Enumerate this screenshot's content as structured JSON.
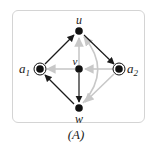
{
  "diagram": {
    "caption": "(A)",
    "colors": {
      "dark_edge": "#1a1a1a",
      "light_edge": "#c8c8c8",
      "node": "#111111",
      "frame_border": "#d4d4d4"
    },
    "nodes": [
      {
        "id": "u",
        "label": "u",
        "x": 79,
        "y": 31,
        "type": "plain"
      },
      {
        "id": "a1",
        "label": "a",
        "sub": "1",
        "x": 40,
        "y": 69,
        "type": "terminal"
      },
      {
        "id": "v",
        "label": "v",
        "x": 79,
        "y": 69,
        "type": "plain"
      },
      {
        "id": "a2",
        "label": "a",
        "sub": "2",
        "x": 119,
        "y": 69,
        "type": "terminal"
      },
      {
        "id": "w",
        "label": "w",
        "x": 79,
        "y": 108,
        "type": "plain"
      }
    ],
    "edges": [
      {
        "from": "a1",
        "to": "u",
        "style": "dark"
      },
      {
        "from": "u",
        "to": "a2",
        "style": "dark"
      },
      {
        "from": "w",
        "to": "a1",
        "style": "dark"
      },
      {
        "from": "v",
        "to": "w",
        "style": "dark"
      },
      {
        "from": "v",
        "to": "a1",
        "style": "light"
      },
      {
        "from": "v",
        "to": "u",
        "style": "light"
      },
      {
        "from": "a2",
        "to": "v",
        "style": "light"
      },
      {
        "from": "a2",
        "to": "w",
        "style": "light"
      },
      {
        "from": "w",
        "to": "u",
        "style": "light",
        "curved": true
      }
    ]
  }
}
